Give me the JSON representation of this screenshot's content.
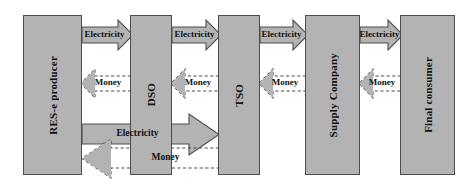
{
  "diagram": {
    "colors": {
      "box_fill": "#b3b3b3",
      "box_stroke": "#4d4d4d",
      "arrow_fill": "#b3b3b3",
      "arrow_stroke": "#4d4d4d",
      "dashed_stroke": "#4d4d4d",
      "background": "#ffffff",
      "text": "#111111"
    },
    "actors": [
      {
        "id": "res-e-producer",
        "label": "RES-e producer",
        "x": 23,
        "y": 15,
        "w": 59,
        "h": 160
      },
      {
        "id": "dso",
        "label": "DSO",
        "x": 130,
        "y": 15,
        "w": 42,
        "h": 160
      },
      {
        "id": "tso",
        "label": "TSO",
        "x": 218,
        "y": 15,
        "w": 42,
        "h": 160
      },
      {
        "id": "supply-company",
        "label": "Supply Company",
        "x": 305,
        "y": 15,
        "w": 55,
        "h": 160
      },
      {
        "id": "final-consumer",
        "label": "Final consumer",
        "x": 400,
        "y": 15,
        "w": 55,
        "h": 160
      }
    ],
    "flows": [
      {
        "id": "electricity-res-dso",
        "label": "Electricity",
        "kind": "electricity",
        "direction": "right",
        "from": "res-e-producer",
        "to": "dso"
      },
      {
        "id": "money-dso-res",
        "label": "Money",
        "kind": "money",
        "direction": "left",
        "from": "dso",
        "to": "res-e-producer"
      },
      {
        "id": "electricity-dso-tso",
        "label": "Electricity",
        "kind": "electricity",
        "direction": "right",
        "from": "dso",
        "to": "tso"
      },
      {
        "id": "money-tso-dso",
        "label": "Money",
        "kind": "money",
        "direction": "left",
        "from": "tso",
        "to": "dso"
      },
      {
        "id": "electricity-tso-supply",
        "label": "Electricity",
        "kind": "electricity",
        "direction": "right",
        "from": "tso",
        "to": "supply-company"
      },
      {
        "id": "money-supply-tso",
        "label": "Money",
        "kind": "money",
        "direction": "left",
        "from": "supply-company",
        "to": "tso"
      },
      {
        "id": "electricity-supply-consumer",
        "label": "Electricity",
        "kind": "electricity",
        "direction": "right",
        "from": "supply-company",
        "to": "final-consumer"
      },
      {
        "id": "money-consumer-supply",
        "label": "Money",
        "kind": "money",
        "direction": "left",
        "from": "final-consumer",
        "to": "supply-company"
      },
      {
        "id": "electricity-res-tso-direct",
        "label": "Electricity",
        "kind": "electricity",
        "direction": "right",
        "from": "res-e-producer",
        "to": "tso"
      },
      {
        "id": "money-tso-res-direct",
        "label": "Money",
        "kind": "money",
        "direction": "left",
        "from": "tso",
        "to": "res-e-producer"
      }
    ]
  }
}
